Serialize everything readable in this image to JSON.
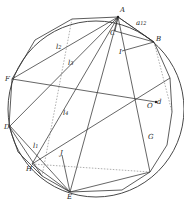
{
  "diagram": {
    "type": "geometric-construction",
    "circle": {
      "cx": 96,
      "cy": 109,
      "r": 88
    },
    "points": {
      "A": {
        "label": "A",
        "x": 118,
        "y": 17
      },
      "B": {
        "label": "B",
        "x": 154,
        "y": 42
      },
      "C": {
        "label": "C",
        "x": 115,
        "y": 31
      },
      "I": {
        "label": "I",
        "x": 122,
        "y": 51
      },
      "F": {
        "label": "F",
        "x": 12,
        "y": 79
      },
      "O": {
        "label": "O",
        "x": 146,
        "y": 102
      },
      "d": {
        "label": "d",
        "x": 154,
        "y": 101
      },
      "D": {
        "label": "D",
        "x": 10,
        "y": 126
      },
      "H": {
        "label": "H",
        "x": 32,
        "y": 164
      },
      "J": {
        "label": "J",
        "x": 62,
        "y": 155
      },
      "G": {
        "label": "G",
        "x": 147,
        "y": 136
      },
      "E": {
        "label": "E",
        "x": 70,
        "y": 192
      }
    },
    "edge_labels": {
      "a12": {
        "label": "a",
        "sub": "12",
        "x": 136,
        "y": 23
      },
      "l2": {
        "label": "l",
        "sub": "2",
        "x": 56,
        "y": 47
      },
      "l3": {
        "label": "l",
        "sub": "3",
        "x": 68,
        "y": 62
      },
      "l4": {
        "label": "l",
        "sub": "4",
        "x": 63,
        "y": 112
      },
      "l1": {
        "label": "l",
        "sub": "1",
        "x": 33,
        "y": 146
      }
    }
  }
}
